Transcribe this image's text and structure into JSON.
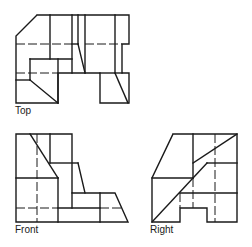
{
  "views": {
    "top": {
      "label": "Top"
    },
    "front": {
      "label": "Front"
    },
    "right": {
      "label": "Right"
    }
  },
  "colors": {
    "line": "#1a1a1a",
    "background": "#ffffff"
  }
}
